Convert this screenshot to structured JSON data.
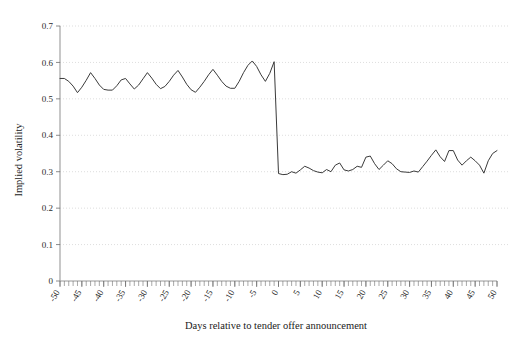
{
  "chart_data": {
    "type": "line",
    "title": "",
    "xlabel": "Days relative to tender offer announcement",
    "ylabel": "Implied volatility",
    "xlim": [
      -50,
      50
    ],
    "ylim": [
      0,
      0.7
    ],
    "grid": true,
    "legend": null,
    "x_tick_labels": [
      "-50",
      "-45",
      "-40",
      "-35",
      "-30",
      "-25",
      "-20",
      "-15",
      "-10",
      "-5",
      "0",
      "5",
      "10",
      "15",
      "20",
      "25",
      "30",
      "35",
      "40",
      "45",
      "50"
    ],
    "x_tick_values": [
      -50,
      -45,
      -40,
      -35,
      -30,
      -25,
      -20,
      -15,
      -10,
      -5,
      0,
      5,
      10,
      15,
      20,
      25,
      30,
      35,
      40,
      45,
      50
    ],
    "x_minor_tick_step": 1,
    "y_tick_labels": [
      "0",
      "0.1",
      "0.2",
      "0.3",
      "0.4",
      "0.5",
      "0.6",
      "0.7"
    ],
    "y_tick_values": [
      0,
      0.1,
      0.2,
      0.3,
      0.4,
      0.5,
      0.6,
      0.7
    ],
    "series": [
      {
        "name": "Implied volatility",
        "color": "#3a3a3a",
        "x": [
          -50,
          -49,
          -48,
          -47,
          -46,
          -45,
          -44,
          -43,
          -42,
          -41,
          -40,
          -39,
          -38,
          -37,
          -36,
          -35,
          -34,
          -33,
          -32,
          -31,
          -30,
          -29,
          -28,
          -27,
          -26,
          -25,
          -24,
          -23,
          -22,
          -21,
          -20,
          -19,
          -18,
          -17,
          -16,
          -15,
          -14,
          -13,
          -12,
          -11,
          -10,
          -9,
          -8,
          -7,
          -6,
          -5,
          -4,
          -3,
          -2,
          -1,
          0,
          1,
          2,
          3,
          4,
          5,
          6,
          7,
          8,
          9,
          10,
          11,
          12,
          13,
          14,
          15,
          16,
          17,
          18,
          19,
          20,
          21,
          22,
          23,
          24,
          25,
          26,
          27,
          28,
          29,
          30,
          31,
          32,
          33,
          34,
          35,
          36,
          37,
          38,
          39,
          40,
          41,
          42,
          43,
          44,
          45,
          46,
          47,
          48,
          49,
          50
        ],
        "values": [
          0.556,
          0.556,
          0.548,
          0.535,
          0.517,
          0.532,
          0.551,
          0.572,
          0.556,
          0.538,
          0.526,
          0.524,
          0.524,
          0.536,
          0.552,
          0.556,
          0.541,
          0.527,
          0.538,
          0.555,
          0.572,
          0.557,
          0.54,
          0.528,
          0.534,
          0.548,
          0.565,
          0.578,
          0.56,
          0.54,
          0.525,
          0.518,
          0.532,
          0.548,
          0.566,
          0.581,
          0.565,
          0.548,
          0.535,
          0.529,
          0.529,
          0.548,
          0.572,
          0.592,
          0.604,
          0.589,
          0.566,
          0.548,
          0.57,
          0.602,
          0.295,
          0.292,
          0.293,
          0.3,
          0.296,
          0.305,
          0.315,
          0.31,
          0.303,
          0.299,
          0.297,
          0.306,
          0.3,
          0.318,
          0.324,
          0.305,
          0.302,
          0.306,
          0.315,
          0.312,
          0.34,
          0.343,
          0.322,
          0.306,
          0.318,
          0.33,
          0.322,
          0.308,
          0.3,
          0.299,
          0.298,
          0.302,
          0.299,
          0.314,
          0.329,
          0.345,
          0.36,
          0.341,
          0.328,
          0.358,
          0.358,
          0.332,
          0.318,
          0.33,
          0.34,
          0.33,
          0.318,
          0.296,
          0.33,
          0.35,
          0.358
        ]
      }
    ]
  }
}
